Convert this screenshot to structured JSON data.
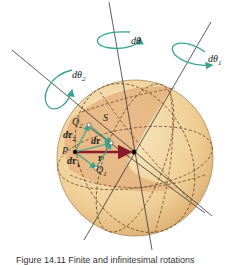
{
  "figure": {
    "labels": {
      "d_theta": "dθ",
      "d_theta_1": "dθ",
      "d_theta_1_sub": "1",
      "d_theta_2": "dθ",
      "d_theta_2_sub": "2",
      "S": "S",
      "Q2": "Q",
      "Q2_sub": "2",
      "Q1": "Q",
      "Q1_sub": "1",
      "P": "P",
      "dr": "dr",
      "dr1": "dr",
      "dr1_sub": "1",
      "dr2": "dr",
      "dr2_sub": "2",
      "r": "r"
    },
    "colors": {
      "sphere_light": "#f3d9a6",
      "sphere_shade": "#e3b07a",
      "rotation_arrows": "#3aa58a",
      "vector_r": "#8b1a2a",
      "vector_green": "#3aa58a",
      "lines": "#333333"
    },
    "caption": "Figure 14.11  Finite and infinitesimal rotations"
  }
}
